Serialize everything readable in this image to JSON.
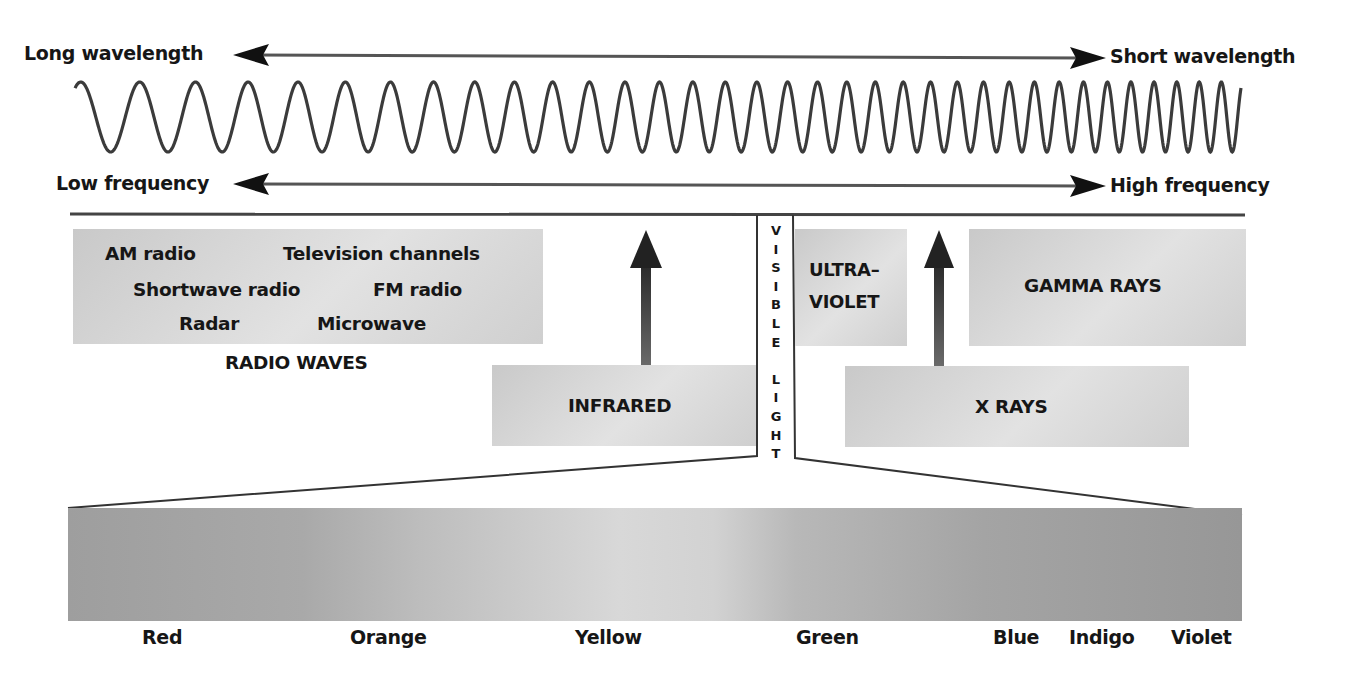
{
  "top_axis": {
    "wavelength": {
      "left": "Long wavelength",
      "right": "Short wavelength"
    },
    "frequency": {
      "left": "Low frequency",
      "right": "High frequency"
    }
  },
  "wave": {
    "description": "sine wave with increasing frequency from left to right",
    "start_x": 75,
    "end_x": 1241,
    "top_y": 82,
    "bottom_y": 152,
    "cycles": 35
  },
  "regions": {
    "radio": {
      "items": [
        "AM radio",
        "Television channels",
        "Shortwave radio",
        "FM radio",
        "Radar",
        "Microwave"
      ],
      "title": "RADIO WAVES"
    },
    "infrared": "INFRARED",
    "visible": {
      "letters": [
        "V",
        "I",
        "S",
        "I",
        "B",
        "L",
        "E",
        "",
        "L",
        "I",
        "G",
        "H",
        "T"
      ],
      "label": "VISIBLE LIGHT"
    },
    "ultraviolet": {
      "line1": "ULTRA–",
      "line2": "VIOLET"
    },
    "xrays": "X RAYS",
    "gamma": "GAMMA RAYS"
  },
  "spectrum": {
    "colors": [
      {
        "name": "Red",
        "x": 163
      },
      {
        "name": "Orange",
        "x": 391
      },
      {
        "name": "Yellow",
        "x": 613
      },
      {
        "name": "Green",
        "x": 829
      },
      {
        "name": "Blue",
        "x": 1019
      },
      {
        "name": "Indigo",
        "x": 1106
      },
      {
        "name": "Violet",
        "x": 1206
      }
    ]
  },
  "colors": {
    "ink": "#161616",
    "line": "#3a3a3a",
    "box": "#d6d6d6"
  }
}
